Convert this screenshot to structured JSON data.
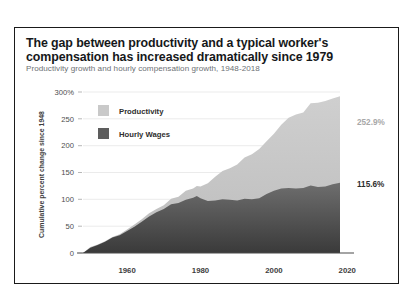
{
  "chart_data": {
    "type": "area",
    "title": "The gap between productivity and a typical worker's compensation has increased dramatically since 1979",
    "subtitle": "Productivity growth and hourly compensation growth, 1948-2018",
    "xlabel": "",
    "ylabel": "Cumulative percent change since 1948",
    "ylim": [
      0,
      300
    ],
    "xlim": [
      1948,
      2018
    ],
    "yticks": [
      "300%",
      "250",
      "200",
      "150",
      "100",
      "50",
      "0"
    ],
    "ytick_values": [
      300,
      250,
      200,
      150,
      100,
      50,
      0
    ],
    "xticks": [
      "1960",
      "1980",
      "2000",
      "2020"
    ],
    "xtick_values": [
      1960,
      1980,
      2000,
      2020
    ],
    "grid": true,
    "legend_position": "top-left",
    "colors": {
      "productivity": "#c9c9c9",
      "hourly_wages": "#5d5d5d",
      "gridline": "#e2e2e2",
      "axis": "#4a4a4a",
      "border": "#1a1a1a"
    },
    "x": [
      1948,
      1950,
      1952,
      1954,
      1956,
      1958,
      1960,
      1962,
      1964,
      1966,
      1968,
      1970,
      1972,
      1974,
      1976,
      1978,
      1979,
      1980,
      1982,
      1984,
      1986,
      1988,
      1990,
      1992,
      1994,
      1996,
      1998,
      2000,
      2002,
      2004,
      2006,
      2008,
      2010,
      2012,
      2014,
      2016,
      2018
    ],
    "series": [
      {
        "name": "Productivity",
        "color": "#c9c9c9",
        "end_label": "252.9%",
        "end_value": 252.9,
        "values": [
          0,
          11,
          16,
          22,
          30,
          35,
          44,
          53,
          63,
          74,
          82,
          89,
          101,
          105,
          116,
          120,
          125,
          124,
          130,
          142,
          153,
          158,
          165,
          178,
          184,
          194,
          208,
          222,
          239,
          252,
          258,
          262,
          279,
          280,
          283,
          288,
          292
        ]
      },
      {
        "name": "Hourly Wages",
        "color": "#5d5d5d",
        "end_label": "115.6%",
        "end_value": 115.6,
        "values": [
          0,
          10,
          15,
          21,
          29,
          33,
          41,
          49,
          58,
          68,
          76,
          82,
          91,
          93,
          99,
          103,
          106,
          102,
          97,
          98,
          100,
          99,
          98,
          101,
          100,
          102,
          110,
          116,
          120,
          121,
          120,
          121,
          126,
          123,
          124,
          128,
          131
        ]
      }
    ],
    "annotations": [
      {
        "text": "252.9%",
        "series": "Productivity",
        "color": "#a8a8a8"
      },
      {
        "text": "115.6%",
        "series": "Hourly Wages",
        "color": "#2e2e2e"
      }
    ]
  },
  "legend": [
    {
      "label": "Productivity",
      "swatch": "#c9c9c9"
    },
    {
      "label": "Hourly Wages",
      "swatch": "#5d5d5d"
    }
  ]
}
